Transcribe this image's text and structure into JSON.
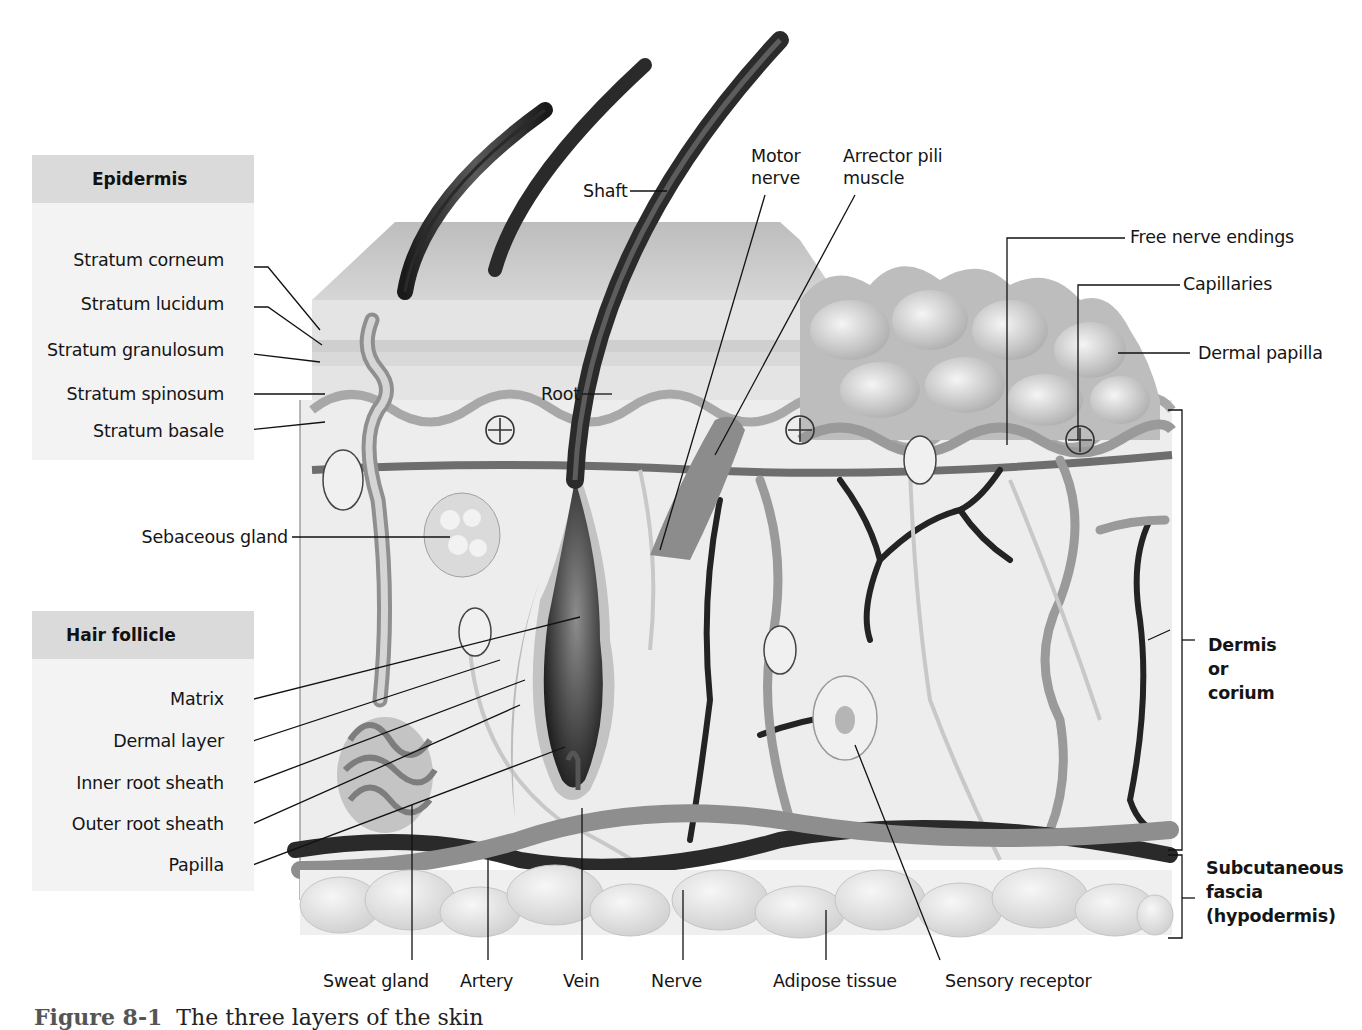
{
  "figure": {
    "caption_number": "Figure 8-1",
    "caption_text": "The three layers of the skin"
  },
  "panels": {
    "epidermis": {
      "title": "Epidermis",
      "items": [
        "Stratum corneum",
        "Stratum lucidum",
        "Stratum granulosum",
        "Stratum spinosum",
        "Stratum basale"
      ]
    },
    "hair_follicle": {
      "title": "Hair follicle",
      "items": [
        "Matrix",
        "Dermal layer",
        "Inner root sheath",
        "Outer root sheath",
        "Papilla"
      ]
    }
  },
  "labels": {
    "sebaceous_gland": "Sebaceous gland",
    "shaft": "Shaft",
    "root": "Root",
    "motor_nerve": [
      "Motor",
      "nerve"
    ],
    "arrector_pili": [
      "Arrector pili",
      "muscle"
    ],
    "free_nerve_endings": "Free nerve endings",
    "capillaries": "Capillaries",
    "dermal_papilla": "Dermal papilla"
  },
  "bottom_labels": [
    "Sweat gland",
    "Artery",
    "Vein",
    "Nerve",
    "Adipose tissue",
    "Sensory receptor"
  ],
  "layers": {
    "dermis": [
      "Dermis",
      "or",
      "corium"
    ],
    "subcutaneous": [
      "Subcutaneous",
      "fascia",
      "(hypodermis)"
    ]
  },
  "colors": {
    "panel_head": "#dadada",
    "panel_body": "#f3f3f3",
    "skin_surface": "#c9c9c9",
    "dermis_fill": "#ededed",
    "vessel_dark": "#2a2a2a",
    "vessel_mid": "#8a8a8a",
    "fat": "#e2e2e2"
  }
}
